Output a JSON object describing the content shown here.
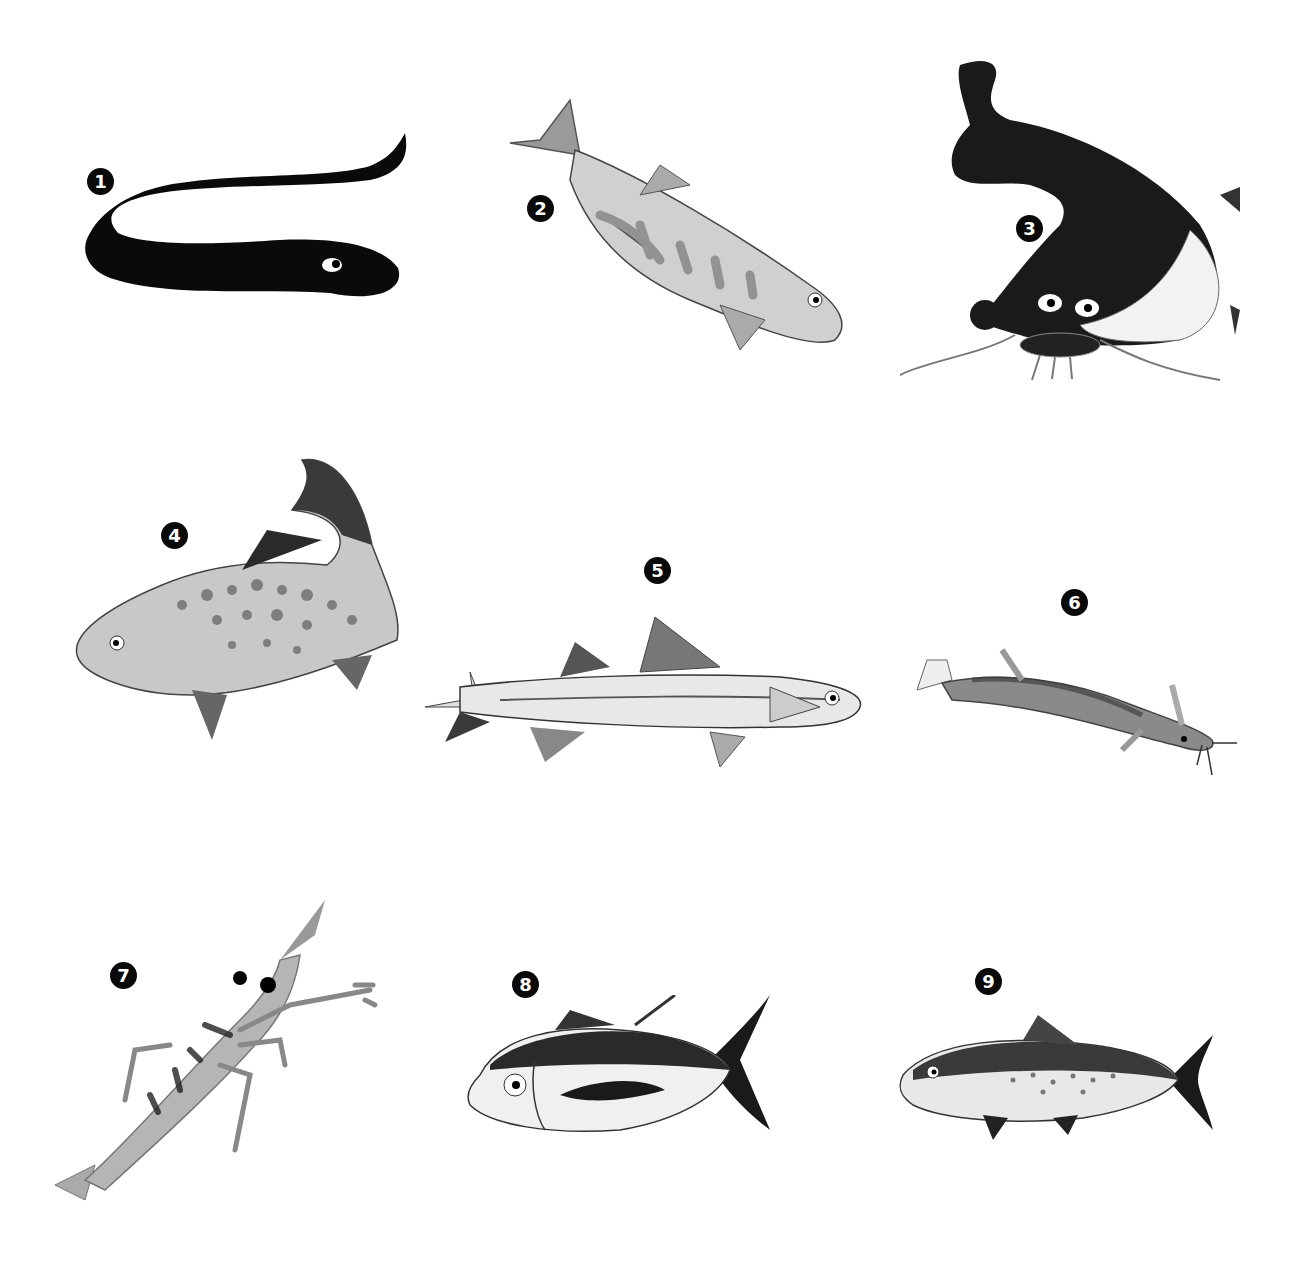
{
  "figure": {
    "background": "#ffffff",
    "palette": {
      "ink": "#0a0a0a",
      "dark": "#2a2a2a",
      "mid": "#7a7a7a",
      "light": "#b8b8b8",
      "pale": "#e6e6e6"
    },
    "items": [
      {
        "number": "1",
        "subject": "eel"
      },
      {
        "number": "2",
        "subject": "trout"
      },
      {
        "number": "3",
        "subject": "catfish"
      },
      {
        "number": "4",
        "subject": "spotted trout"
      },
      {
        "number": "5",
        "subject": "slender silver fish"
      },
      {
        "number": "6",
        "subject": "loach"
      },
      {
        "number": "7",
        "subject": "shrimp"
      },
      {
        "number": "8",
        "subject": "tuna"
      },
      {
        "number": "9",
        "subject": "salmon"
      }
    ]
  }
}
